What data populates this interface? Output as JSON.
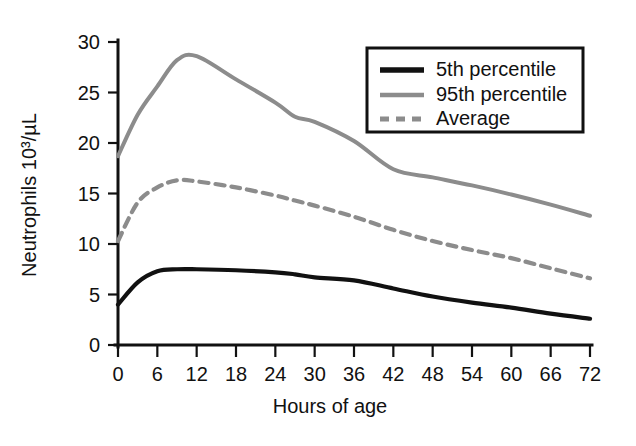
{
  "chart_data": {
    "type": "line",
    "title": "",
    "xlabel": "Hours of age",
    "ylabel": "Neutrophils 10³/µL",
    "xlim": [
      0,
      72
    ],
    "ylim": [
      0,
      30
    ],
    "grid": false,
    "legend_position": "top-right",
    "x_ticks": [
      "0",
      "6",
      "12",
      "18",
      "24",
      "30",
      "36",
      "42",
      "48",
      "54",
      "60",
      "66",
      "72"
    ],
    "y_ticks": [
      "0",
      "5",
      "10",
      "15",
      "20",
      "25",
      "30"
    ],
    "x": [
      0,
      3,
      6,
      9,
      12,
      18,
      24,
      27,
      30,
      36,
      42,
      48,
      54,
      60,
      66,
      72
    ],
    "series": [
      {
        "name": "5th percentile",
        "color": "#111111",
        "style": "solid",
        "width": 4.2,
        "values": [
          4.0,
          6.2,
          7.3,
          7.5,
          7.5,
          7.4,
          7.2,
          7.0,
          6.7,
          6.4,
          5.6,
          4.8,
          4.2,
          3.7,
          3.1,
          2.6
        ]
      },
      {
        "name": "95th percentile",
        "color": "#8c8c8c",
        "style": "solid",
        "width": 4.0,
        "values": [
          18.7,
          22.8,
          25.6,
          28.2,
          28.6,
          26.3,
          24.0,
          22.6,
          22.1,
          20.2,
          17.4,
          16.6,
          15.8,
          14.9,
          13.9,
          12.8
        ]
      },
      {
        "name": "Average",
        "color": "#8c8c8c",
        "style": "dashed",
        "width": 4.2,
        "values": [
          10.3,
          14.1,
          15.6,
          16.3,
          16.2,
          15.6,
          14.8,
          14.3,
          13.8,
          12.7,
          11.4,
          10.3,
          9.4,
          8.6,
          7.6,
          6.6
        ]
      }
    ]
  },
  "legend": {
    "entries": [
      {
        "label": "5th percentile"
      },
      {
        "label": "95th percentile"
      },
      {
        "label": "Average"
      }
    ]
  }
}
